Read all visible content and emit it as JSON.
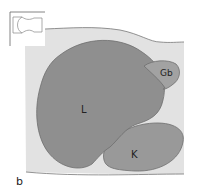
{
  "figure": {
    "panel_label": "b",
    "labels": {
      "liver": "L",
      "gallbladder": "Gb",
      "kidney": "K"
    },
    "colors": {
      "background_tissue": "#e2e2e2",
      "liver": "#8f8f8f",
      "gallbladder": "#a2a2a2",
      "kidney": "#999999",
      "outline": "#6e6e6e"
    }
  }
}
